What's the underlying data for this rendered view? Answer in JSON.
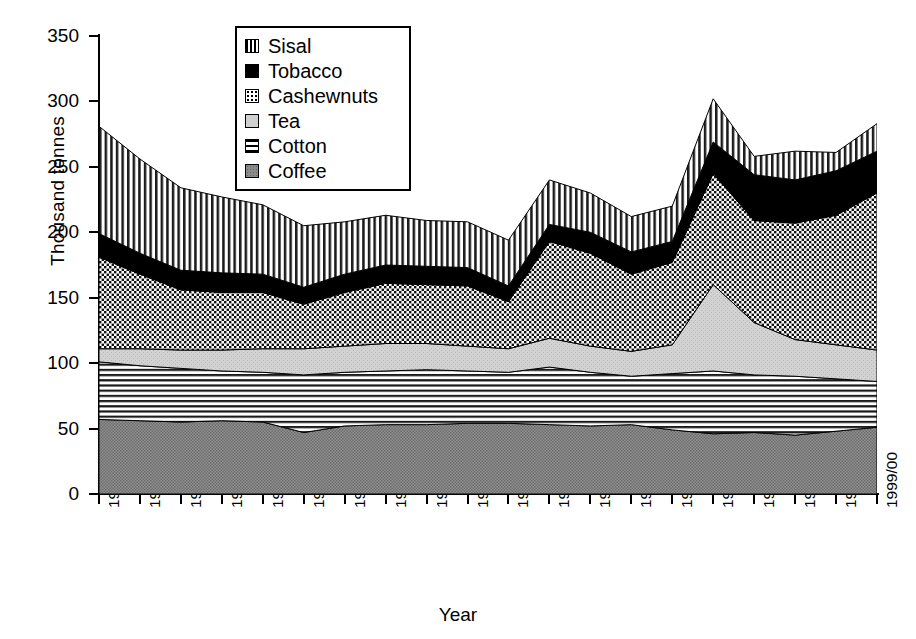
{
  "chart_data": {
    "type": "area",
    "stacked": true,
    "title": "",
    "xlabel": "Year",
    "ylabel": "Thousand tonnes",
    "ylim": [
      0,
      350
    ],
    "ytick_step": 50,
    "yticks": [
      "0",
      "50",
      "100",
      "150",
      "200",
      "250",
      "300",
      "350"
    ],
    "grid": false,
    "legend_position": "top-center-inside",
    "categories": [
      "1980/81",
      "1981/82",
      "1982/83",
      "1983/84",
      "1984/85",
      "1985/86",
      "1986/87",
      "1987/88",
      "1988/89",
      "1989/90",
      "1990/91",
      "1991/92",
      "1992/93",
      "1993/94",
      "1994/95",
      "1995/96",
      "1996/97",
      "1997/98",
      "1998/99",
      "1999/00"
    ],
    "stack_order_bottom_to_top": [
      "Coffee",
      "Cotton",
      "Tea",
      "Cashewnuts",
      "Tobacco",
      "Sisal"
    ],
    "series": [
      {
        "name": "Coffee",
        "pattern": "solid-dark-gray",
        "color": "#8a8a8a",
        "values": [
          57,
          56,
          55,
          56,
          55,
          47,
          52,
          53,
          53,
          54,
          54,
          53,
          52,
          53,
          49,
          46,
          47,
          45,
          48,
          51
        ]
      },
      {
        "name": "Cotton",
        "pattern": "horizontal-lines",
        "color": "#ffffff",
        "values": [
          44,
          42,
          41,
          38,
          38,
          44,
          41,
          41,
          42,
          40,
          39,
          44,
          41,
          37,
          43,
          48,
          44,
          45,
          40,
          35
        ]
      },
      {
        "name": "Tea",
        "pattern": "light-gray",
        "color": "#cfcfcf",
        "values": [
          10,
          13,
          14,
          16,
          18,
          20,
          20,
          21,
          20,
          19,
          18,
          22,
          20,
          19,
          22,
          66,
          40,
          28,
          26,
          24
        ]
      },
      {
        "name": "Cashewnuts",
        "pattern": "dotted",
        "color": "#ffffff",
        "values": [
          70,
          57,
          46,
          44,
          43,
          34,
          41,
          46,
          45,
          46,
          36,
          74,
          71,
          59,
          63,
          85,
          78,
          89,
          99,
          120
        ]
      },
      {
        "name": "Tobacco",
        "pattern": "solid-black",
        "color": "#000000",
        "values": [
          18,
          16,
          15,
          15,
          14,
          13,
          14,
          14,
          14,
          14,
          12,
          13,
          16,
          17,
          16,
          24,
          35,
          33,
          34,
          32
        ]
      },
      {
        "name": "Sisal",
        "pattern": "vertical-lines",
        "color": "#ffffff",
        "values": [
          82,
          72,
          63,
          58,
          53,
          47,
          40,
          38,
          35,
          35,
          35,
          34,
          30,
          27,
          27,
          33,
          14,
          22,
          14,
          21
        ]
      }
    ],
    "totals": [
      281,
      256,
      234,
      227,
      221,
      205,
      208,
      213,
      209,
      208,
      194,
      240,
      230,
      212,
      220,
      302,
      258,
      262,
      261,
      283
    ],
    "legend_entries": [
      {
        "label": "Sisal",
        "pattern": "vertical-lines"
      },
      {
        "label": "Tobacco",
        "pattern": "solid-black"
      },
      {
        "label": "Cashewnuts",
        "pattern": "dotted"
      },
      {
        "label": "Tea",
        "pattern": "light-gray"
      },
      {
        "label": "Cotton",
        "pattern": "horizontal-lines"
      },
      {
        "label": "Coffee",
        "pattern": "solid-dark-gray"
      }
    ]
  }
}
